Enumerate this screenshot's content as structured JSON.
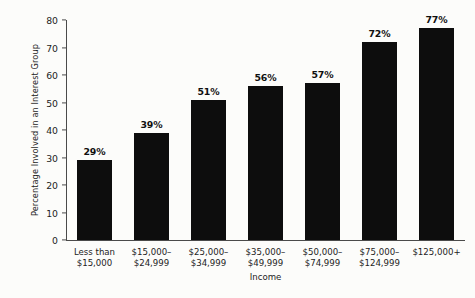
{
  "chart_data": {
    "type": "bar",
    "title": "",
    "xlabel": "Income",
    "ylabel": "Percentage Involved in an Interest Group",
    "categories": [
      "Less than\n$15,000",
      "$15,000–\n$24,999",
      "$25,000–\n$34,999",
      "$35,000–\n$49,999",
      "$50,000–\n$74,999",
      "$75,000–\n$124,999",
      "$125,000+"
    ],
    "category_lines": [
      [
        "Less than",
        "$15,000"
      ],
      [
        "$15,000–",
        "$24,999"
      ],
      [
        "$25,000–",
        "$34,999"
      ],
      [
        "$35,000–",
        "$49,999"
      ],
      [
        "$50,000–",
        "$74,999"
      ],
      [
        "$75,000–",
        "$124,999"
      ],
      [
        "$125,000+",
        ""
      ]
    ],
    "values": [
      29,
      39,
      51,
      56,
      57,
      72,
      77
    ],
    "value_labels": [
      "29%",
      "39%",
      "51%",
      "56%",
      "57%",
      "72%",
      "77%"
    ],
    "ylim": [
      0,
      80
    ],
    "yticks": [
      0,
      10,
      20,
      30,
      40,
      50,
      60,
      70,
      80
    ],
    "ytick_labels": [
      "0",
      "10",
      "20",
      "30",
      "40",
      "50",
      "60",
      "70",
      "80"
    ],
    "grid": false,
    "legend": null,
    "bar_color": "#0d0d0d",
    "axis_color": "#4a4a4a",
    "background_color": "#fcfcfa"
  }
}
